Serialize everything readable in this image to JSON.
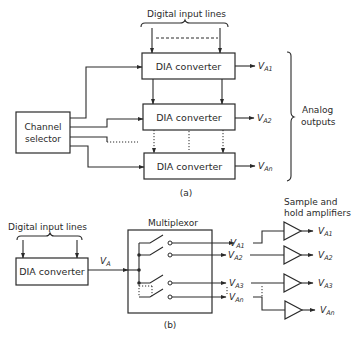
{
  "part_a": {
    "digital_input_label": "Digital input lines",
    "converters": [
      {
        "label": "DIA converter",
        "output": "V",
        "output_sub": "A1"
      },
      {
        "label": "DIA converter",
        "output": "V",
        "output_sub": "A2"
      },
      {
        "label": "DIA converter",
        "output": "V",
        "output_sub": "An"
      }
    ],
    "channel_selector": {
      "line1": "Channel",
      "line2": "selector"
    },
    "analog_outputs": {
      "line1": "Analog",
      "line2": "outputs"
    },
    "caption": "(a)"
  },
  "part_b": {
    "digital_input_label": "Digital input lines",
    "converter_label": "DIA converter",
    "converter_output": "V",
    "converter_output_sub": "A",
    "multiplexor_label": "Multiplexor",
    "mux_outputs": [
      {
        "v": "V",
        "sub": "A1"
      },
      {
        "v": "V",
        "sub": "A2"
      },
      {
        "v": "V",
        "sub": "A3"
      },
      {
        "v": "V",
        "sub": "An"
      }
    ],
    "sample_hold": {
      "line1": "Sample and",
      "line2": "hold amplifiers"
    },
    "amp_outputs": [
      {
        "v": "V",
        "sub": "A1"
      },
      {
        "v": "V",
        "sub": "A2"
      },
      {
        "v": "V",
        "sub": "A3"
      },
      {
        "v": "V",
        "sub": "An"
      }
    ],
    "caption": "(b)"
  }
}
